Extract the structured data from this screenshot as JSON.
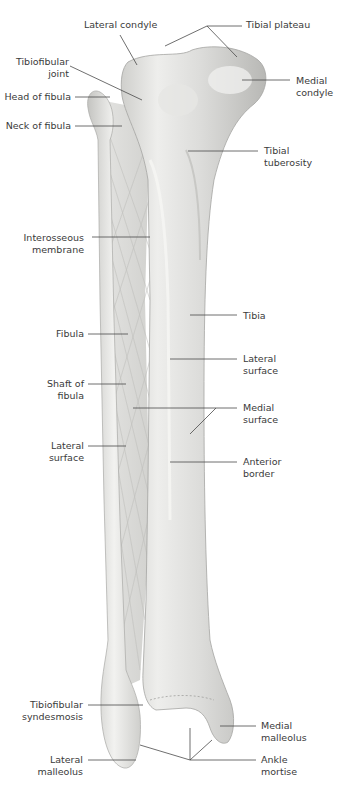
{
  "figure": {
    "colors": {
      "bone_light": "#f1f1ef",
      "bone_mid": "#d9d9d6",
      "bone_shadow": "#b9b9b6",
      "leader": "#4a4a4a",
      "text": "#3a3a3a"
    }
  },
  "labels": {
    "lateral_condyle": "Lateral condyle",
    "tibial_plateau": "Tibial plateau",
    "tibiofibular_joint_1": "Tibiofibular",
    "tibiofibular_joint_2": "joint",
    "medial_condyle_1": "Medial",
    "medial_condyle_2": "condyle",
    "head_of_fibula": "Head of fibula",
    "neck_of_fibula": "Neck of fibula",
    "tibial_tuberosity_1": "Tibial",
    "tibial_tuberosity_2": "tuberosity",
    "interosseous_membrane_1": "Interosseous",
    "interosseous_membrane_2": "membrane",
    "tibia": "Tibia",
    "fibula": "Fibula",
    "tibia_lateral_surface_1": "Lateral",
    "tibia_lateral_surface_2": "surface",
    "shaft_of_fibula_1": "Shaft of",
    "shaft_of_fibula_2": "fibula",
    "medial_surface_1": "Medial",
    "medial_surface_2": "surface",
    "fibula_lateral_surface_1": "Lateral",
    "fibula_lateral_surface_2": "surface",
    "anterior_border_1": "Anterior",
    "anterior_border_2": "border",
    "tibiofibular_syndesmosis_1": "Tibiofibular",
    "tibiofibular_syndesmosis_2": "syndesmosis",
    "medial_malleolus_1": "Medial",
    "medial_malleolus_2": "malleolus",
    "lateral_malleolus_1": "Lateral",
    "lateral_malleolus_2": "malleolus",
    "ankle_mortise_1": "Ankle",
    "ankle_mortise_2": "mortise"
  }
}
